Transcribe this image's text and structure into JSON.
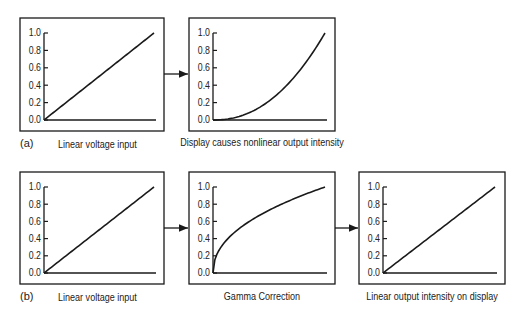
{
  "figure": {
    "rows": [
      {
        "tag": "(a)",
        "panels": [
          {
            "id": "a1",
            "caption": "Linear voltage input",
            "curve": "linear"
          },
          {
            "id": "a2",
            "caption": "Display causes nonlinear output intensity",
            "curve": "power_2.2"
          }
        ]
      },
      {
        "tag": "(b)",
        "panels": [
          {
            "id": "b1",
            "caption": "Linear voltage input",
            "curve": "linear"
          },
          {
            "id": "b2",
            "caption": "Gamma Correction",
            "curve": "power_1/2.2"
          },
          {
            "id": "b3",
            "caption": "Linear output intensity on display",
            "curve": "linear"
          }
        ]
      }
    ],
    "y_ticks": [
      "0.0",
      "0.2",
      "0.4",
      "0.6",
      "0.8",
      "1.0"
    ]
  },
  "chart_data": [
    {
      "type": "line",
      "title": "Linear voltage input",
      "panel": "(a) left",
      "x": [
        0,
        0.25,
        0.5,
        0.75,
        1.0
      ],
      "y": [
        0,
        0.25,
        0.5,
        0.75,
        1.0
      ],
      "ylim": [
        0,
        1
      ],
      "y_ticks": [
        0,
        0.2,
        0.4,
        0.6,
        0.8,
        1.0
      ]
    },
    {
      "type": "line",
      "title": "Display causes nonlinear output intensity",
      "panel": "(a) right",
      "x": [
        0,
        0.25,
        0.5,
        0.75,
        1.0
      ],
      "y": [
        0,
        0.05,
        0.22,
        0.53,
        1.0
      ],
      "ylim": [
        0,
        1
      ],
      "y_ticks": [
        0,
        0.2,
        0.4,
        0.6,
        0.8,
        1.0
      ]
    },
    {
      "type": "line",
      "title": "Linear voltage input",
      "panel": "(b) left",
      "x": [
        0,
        0.25,
        0.5,
        0.75,
        1.0
      ],
      "y": [
        0,
        0.25,
        0.5,
        0.75,
        1.0
      ],
      "ylim": [
        0,
        1
      ],
      "y_ticks": [
        0,
        0.2,
        0.4,
        0.6,
        0.8,
        1.0
      ]
    },
    {
      "type": "line",
      "title": "Gamma Correction",
      "panel": "(b) middle",
      "x": [
        0,
        0.25,
        0.5,
        0.75,
        1.0
      ],
      "y": [
        0,
        0.53,
        0.73,
        0.88,
        1.0
      ],
      "ylim": [
        0,
        1
      ],
      "y_ticks": [
        0,
        0.2,
        0.4,
        0.6,
        0.8,
        1.0
      ]
    },
    {
      "type": "line",
      "title": "Linear output intensity on display",
      "panel": "(b) right",
      "x": [
        0,
        0.25,
        0.5,
        0.75,
        1.0
      ],
      "y": [
        0,
        0.25,
        0.5,
        0.75,
        1.0
      ],
      "ylim": [
        0,
        1
      ],
      "y_ticks": [
        0,
        0.2,
        0.4,
        0.6,
        0.8,
        1.0
      ]
    }
  ]
}
